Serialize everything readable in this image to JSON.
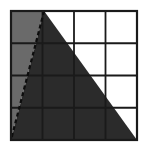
{
  "figure": {
    "title": "",
    "type": "geometry-grid-triangle",
    "canvas": {
      "width": 148,
      "height": 157,
      "background": "#ffffff"
    },
    "grid": {
      "columns": 4,
      "rows": 4,
      "x0": 11,
      "y0": 11,
      "x1": 137,
      "y1": 140,
      "cell_width": 31.5,
      "cell_height": 32.25,
      "outer_border_color": "#1a1a1a",
      "outer_border_width": 2.2,
      "inner_line_color": "#1a1a1a",
      "inner_line_width": 1.8,
      "cell_fill": "#ffffff"
    },
    "shapes": [
      {
        "name": "main-triangle",
        "role": "primary-shaded-region",
        "fill": "#2b2b2b",
        "vertices_cells": [
          [
            1.05,
            0
          ],
          [
            0,
            4
          ],
          [
            4,
            4
          ]
        ],
        "vertices_px": [
          [
            44.1,
            11
          ],
          [
            11,
            140
          ],
          [
            137,
            140
          ]
        ]
      },
      {
        "name": "light-wedge",
        "role": "secondary-shaded-region",
        "fill": "#6a6a6a",
        "vertices_cells": [
          [
            1.05,
            0
          ],
          [
            0,
            0
          ],
          [
            0,
            4
          ]
        ],
        "vertices_px": [
          [
            44.1,
            11
          ],
          [
            11,
            11
          ],
          [
            11,
            140
          ]
        ]
      }
    ],
    "edges": [
      {
        "name": "dashed-hypotenuse",
        "style": "dashed",
        "color": "#0d0d0d",
        "width": 2.2,
        "dash_pattern": "4 3",
        "from_px": [
          44.1,
          11
        ],
        "to_px": [
          11,
          140
        ]
      },
      {
        "name": "solid-right-edge",
        "style": "solid",
        "color": "#2b2b2b",
        "width": 1,
        "from_px": [
          44.1,
          11
        ],
        "to_px": [
          137,
          140
        ]
      }
    ],
    "labels": []
  },
  "chart_data": {
    "type": "table",
    "title": "",
    "xlabel": "",
    "ylabel": "",
    "categories": [
      "col-1",
      "col-2",
      "col-3",
      "col-4"
    ],
    "rows": [
      "row-1",
      "row-2",
      "row-3",
      "row-4"
    ],
    "grid": true,
    "legend": "none"
  }
}
